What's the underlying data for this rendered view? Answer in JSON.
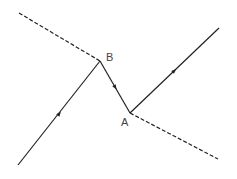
{
  "diagram": {
    "points": {
      "B": {
        "label": "B",
        "x": 100,
        "y": 61
      },
      "A": {
        "label": "A",
        "x": 130,
        "y": 113
      }
    },
    "lines": [
      {
        "name": "dashed-upper-left",
        "style": "dashed",
        "from": [
          19,
          13
        ],
        "to": [
          100,
          61
        ]
      },
      {
        "name": "dashed-lower-right",
        "style": "dashed",
        "from": [
          130,
          113
        ],
        "to": [
          218,
          159
        ]
      },
      {
        "name": "incoming-ray",
        "style": "solid",
        "from": [
          18,
          165
        ],
        "to": [
          100,
          61
        ],
        "arrow": [
          59,
          114
        ]
      },
      {
        "name": "segment-BA",
        "style": "solid",
        "from": [
          100,
          61
        ],
        "to": [
          130,
          113
        ],
        "arrow": [
          115,
          87
        ]
      },
      {
        "name": "outgoing-ray",
        "style": "solid",
        "from": [
          130,
          113
        ],
        "to": [
          219,
          28
        ],
        "arrow": [
          174,
          71
        ]
      }
    ],
    "color": "#222222"
  }
}
